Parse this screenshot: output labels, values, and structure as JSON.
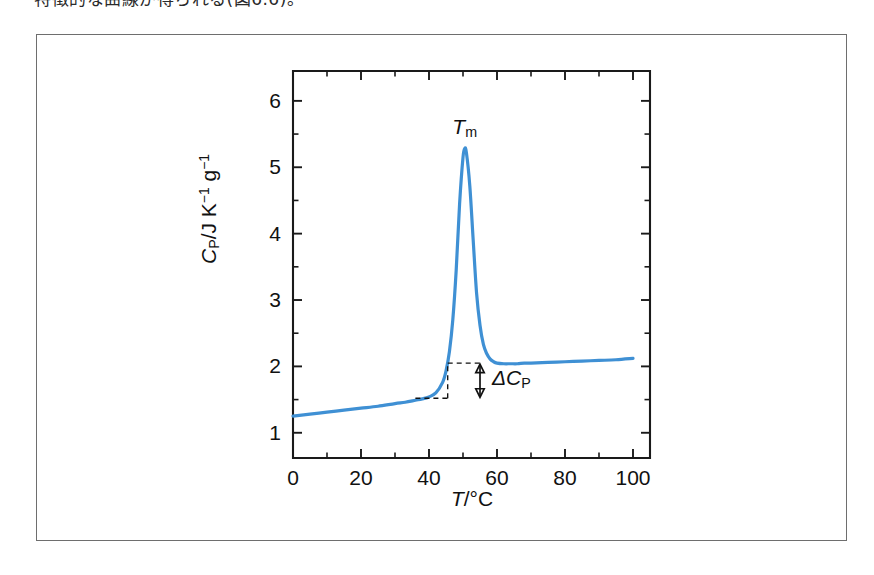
{
  "page": {
    "caption_line": "特徴的な曲線が得られる(図6.6)。"
  },
  "figure": {
    "frame_color": "#6e6e6e",
    "background": "#ffffff"
  },
  "chart_data": {
    "type": "line",
    "title": "",
    "subtitle": "",
    "xlabel_parts": {
      "symbol": "T",
      "separator": "/",
      "unit": "°C"
    },
    "ylabel_parts": {
      "symbol": "C",
      "symbol_sub": "P",
      "separator": "/",
      "unit_j": "J K",
      "unit_k_exp": "−1",
      "unit_g": " g",
      "unit_g_exp": "−1"
    },
    "xlabel": "T/°C",
    "ylabel": "Cp/J K-1 g-1",
    "xlim": [
      0,
      105
    ],
    "ylim": [
      0.62,
      6.45
    ],
    "x_major_ticks": [
      0,
      20,
      40,
      60,
      80,
      100
    ],
    "x_major_tick_labels": [
      "0",
      "20",
      "40",
      "60",
      "80",
      "100"
    ],
    "x_minor_ticks": [
      10,
      30,
      50,
      70,
      90
    ],
    "y_major_ticks": [
      1,
      2,
      3,
      4,
      5,
      6
    ],
    "y_major_tick_labels": [
      "1",
      "2",
      "3",
      "4",
      "5",
      "6"
    ],
    "y_minor_ticks": [
      1.5,
      2.5,
      3.5,
      4.5,
      5.5,
      6.5
    ],
    "grid": false,
    "legend": "none",
    "series": [
      {
        "name": "heat capacity",
        "color": "#3f90d4",
        "x": [
          0,
          5,
          10,
          15,
          20,
          25,
          30,
          33,
          36,
          38,
          40,
          42,
          44,
          45,
          46,
          47,
          48,
          49,
          50,
          50.5,
          51,
          52,
          53,
          54,
          55,
          56,
          57,
          58,
          59,
          60,
          62,
          64,
          66,
          68,
          70,
          75,
          80,
          85,
          90,
          95,
          100
        ],
        "y": [
          1.25,
          1.28,
          1.31,
          1.34,
          1.37,
          1.4,
          1.44,
          1.46,
          1.49,
          1.51,
          1.54,
          1.6,
          1.76,
          1.93,
          2.22,
          2.7,
          3.45,
          4.45,
          5.15,
          5.28,
          5.22,
          4.72,
          3.9,
          3.1,
          2.62,
          2.33,
          2.19,
          2.11,
          2.07,
          2.05,
          2.04,
          2.04,
          2.04,
          2.05,
          2.05,
          2.06,
          2.07,
          2.08,
          2.09,
          2.1,
          2.12
        ]
      }
    ],
    "annotations": [
      {
        "name": "peak-label",
        "text_symbol": "T",
        "text_sub": "m",
        "x": 50.5,
        "y": 5.28,
        "meaning": "melting transition midpoint temperature"
      },
      {
        "name": "delta-cp-label",
        "text_symbol": "ΔC",
        "text_sub": "P",
        "meaning": "heat capacity change between pre- and post-transition baselines",
        "baseline_low": 1.52,
        "baseline_high": 2.05,
        "bracket_x_left": 45.5,
        "bracket_x_right": 55.0,
        "arrow_x": 55.0
      }
    ]
  },
  "axes_geometry": {
    "left_px": 293,
    "right_px": 650,
    "top_px": 71,
    "bottom_px": 458
  }
}
